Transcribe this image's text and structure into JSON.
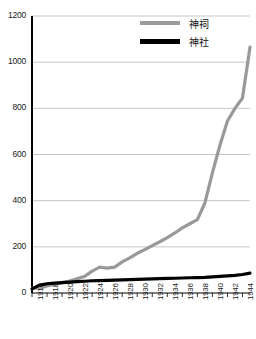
{
  "chart_data": {
    "type": "line",
    "title": "",
    "xlabel": "",
    "ylabel": "",
    "ylim": [
      0,
      1200
    ],
    "xlim": [
      1916,
      1945
    ],
    "grid": true,
    "legend_position": "top-right",
    "ytick_labels": [
      "1200",
      "1000",
      "800",
      "600",
      "400",
      "200",
      "0"
    ],
    "ytick_values": [
      1200,
      1000,
      800,
      600,
      400,
      200,
      0
    ],
    "xtick_labels": [
      "1916",
      "1918",
      "1920",
      "1922",
      "1924",
      "1926",
      "1928",
      "1930",
      "1932",
      "1934",
      "1936",
      "1938",
      "1940",
      "1942",
      "1944"
    ],
    "xtick_values": [
      1916,
      1918,
      1920,
      1922,
      1924,
      1926,
      1928,
      1930,
      1932,
      1934,
      1936,
      1938,
      1940,
      1942,
      1944
    ],
    "x": [
      1916,
      1917,
      1918,
      1919,
      1920,
      1921,
      1922,
      1923,
      1924,
      1925,
      1926,
      1927,
      1928,
      1929,
      1930,
      1931,
      1932,
      1933,
      1934,
      1935,
      1936,
      1937,
      1938,
      1939,
      1940,
      1941,
      1942,
      1943,
      1944,
      1945
    ],
    "series": [
      {
        "name": "神祠",
        "color": "#999999",
        "width": 3.2,
        "values": [
          20,
          22,
          30,
          38,
          45,
          52,
          62,
          72,
          95,
          112,
          108,
          112,
          135,
          152,
          172,
          188,
          205,
          222,
          240,
          260,
          282,
          300,
          318,
          390,
          520,
          640,
          745,
          800,
          845,
          1065
        ]
      },
      {
        "name": "神社",
        "color": "#000000",
        "width": 3.2,
        "values": [
          18,
          34,
          40,
          43,
          45,
          47,
          49,
          51,
          53,
          54,
          55,
          56,
          57,
          58,
          59,
          60,
          61,
          62,
          63,
          64,
          65,
          66,
          67,
          68,
          70,
          72,
          74,
          76,
          80,
          86
        ]
      }
    ],
    "colors": {
      "axis": "#000000",
      "grid": "#b8b8b8",
      "background": "#ffffff",
      "series_1": "#999999",
      "series_2": "#000000"
    }
  },
  "legend": {
    "items": [
      {
        "label": "神祠",
        "color": "#999999"
      },
      {
        "label": "神社",
        "color": "#000000"
      }
    ]
  }
}
